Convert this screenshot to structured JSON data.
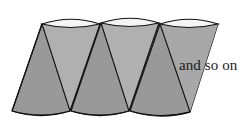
{
  "figure": {
    "caption": "and so on",
    "colors": {
      "background": "#ffffff",
      "body_fill": "#999999",
      "highlight_fill": "#b3b3b3",
      "shadow_fill": "#8f8f8f",
      "outline": "#111111",
      "top_band": "#f2f2f2",
      "text": "#1a1a1a"
    },
    "shapes": [
      {
        "name": "frustum-1",
        "label": "cone frustum 1 (leftmost, partially cropped)",
        "top_left_x": 42,
        "top_right_x": 100,
        "top_y": 24,
        "bottom_left_x": 12,
        "bottom_right_x": 70,
        "bottom_y": 111,
        "apex_x": 70,
        "ellipse_ry": 5
      },
      {
        "name": "frustum-2",
        "label": "cone frustum 2 (middle)",
        "top_left_x": 101,
        "top_right_x": 159,
        "top_y": 23,
        "bottom_left_x": 71,
        "bottom_right_x": 129,
        "bottom_y": 111,
        "apex_x": 129,
        "ellipse_ry": 5
      },
      {
        "name": "frustum-3",
        "label": "cone frustum 3 (rightmost visible)",
        "top_left_x": 160,
        "top_right_x": 218,
        "top_y": 24,
        "bottom_left_x": 130,
        "bottom_right_x": 190,
        "bottom_y": 112,
        "apex_x": 190,
        "ellipse_ry": 5
      }
    ],
    "counts": {
      "visible_frustums": 3
    }
  }
}
